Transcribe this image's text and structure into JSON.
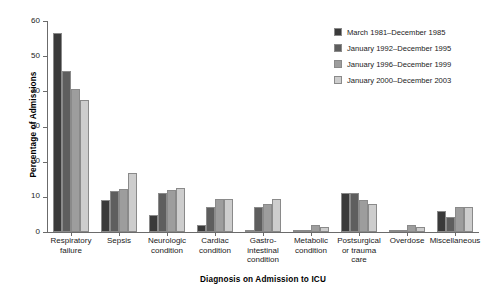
{
  "chart_data": {
    "type": "bar",
    "title": "",
    "xlabel": "Diagnosis on Admission to ICU",
    "ylabel": "Percentage of Admissions",
    "ylim": [
      0,
      60
    ],
    "yticks": [
      0,
      10,
      20,
      30,
      40,
      50,
      60
    ],
    "grid": false,
    "legend_position": "top-right",
    "categories": [
      "Respiratory failure",
      "Sepsis",
      "Neurologic condition",
      "Cardiac condition",
      "Gastro-intestinal condition",
      "Metabolic condition",
      "Postsurgical or trauma care",
      "Overdose",
      "Miscellaneous"
    ],
    "category_lines": [
      [
        "Respiratory",
        "failure"
      ],
      [
        "Sepsis"
      ],
      [
        "Neurologic",
        "condition"
      ],
      [
        "Cardiac",
        "condition"
      ],
      [
        "Gastro-",
        "intestinal",
        "condition"
      ],
      [
        "Metabolic",
        "condition"
      ],
      [
        "Postsurgical",
        "or trauma",
        "care"
      ],
      [
        "Overdose"
      ],
      [
        "Miscellaneous"
      ]
    ],
    "series": [
      {
        "name": "March 1981–December 1985",
        "color": "#3a3a3a",
        "values": [
          56.7,
          9.2,
          4.8,
          2.1,
          0.2,
          0.2,
          11.0,
          0.2,
          6.0
        ]
      },
      {
        "name": "January 1992–December 1995",
        "color": "#5e5e5e",
        "values": [
          45.8,
          11.6,
          11.1,
          7.0,
          7.0,
          0.3,
          11.1,
          0.3,
          4.2
        ]
      },
      {
        "name": "January 1996–December 1999",
        "color": "#9d9d9d",
        "values": [
          40.6,
          12.1,
          12.0,
          9.4,
          8.0,
          2.0,
          9.0,
          2.0,
          7.1
        ]
      },
      {
        "name": "January 2000–December 2003",
        "color": "#cdcdcd",
        "values": [
          37.6,
          16.9,
          12.6,
          9.5,
          9.4,
          1.5,
          8.0,
          1.5,
          7.0
        ]
      }
    ]
  },
  "legend": {
    "items": [
      "March 1981–December 1985",
      "January 1992–December 1995",
      "January 1996–December 1999",
      "January 2000–December 2003"
    ]
  },
  "axes": {
    "y_title": "Percentage of Admissions",
    "x_title": "Diagnosis on Admission to ICU",
    "y_tick_labels": [
      "0",
      "10",
      "20",
      "30",
      "40",
      "50",
      "60"
    ]
  },
  "colors": {
    "axis": "#6b6b6b",
    "text": "#1a1a1a",
    "background": "#ffffff"
  }
}
